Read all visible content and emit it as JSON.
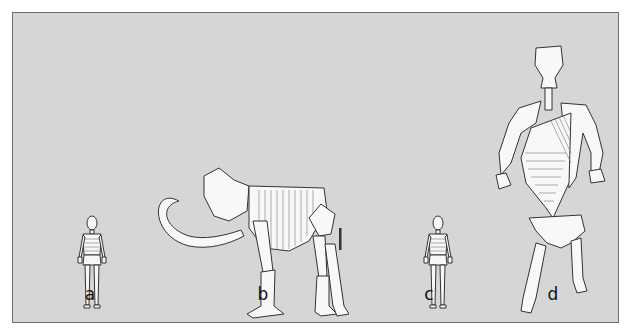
{
  "figure": {
    "panels": [
      {
        "id": "a",
        "label": "a",
        "subject": "human skeleton (scale reference)"
      },
      {
        "id": "b",
        "label": "b",
        "subject": "mammoth skeleton"
      },
      {
        "id": "c",
        "label": "c",
        "subject": "human skeleton (scale reference)"
      },
      {
        "id": "d",
        "label": "d",
        "subject": "upright giant / reconstructed skeleton"
      }
    ],
    "colors": {
      "background": "#d6d6d6",
      "border": "#6e6e6e",
      "bone_fill": "#f8f8f8",
      "outline": "#333333"
    }
  }
}
